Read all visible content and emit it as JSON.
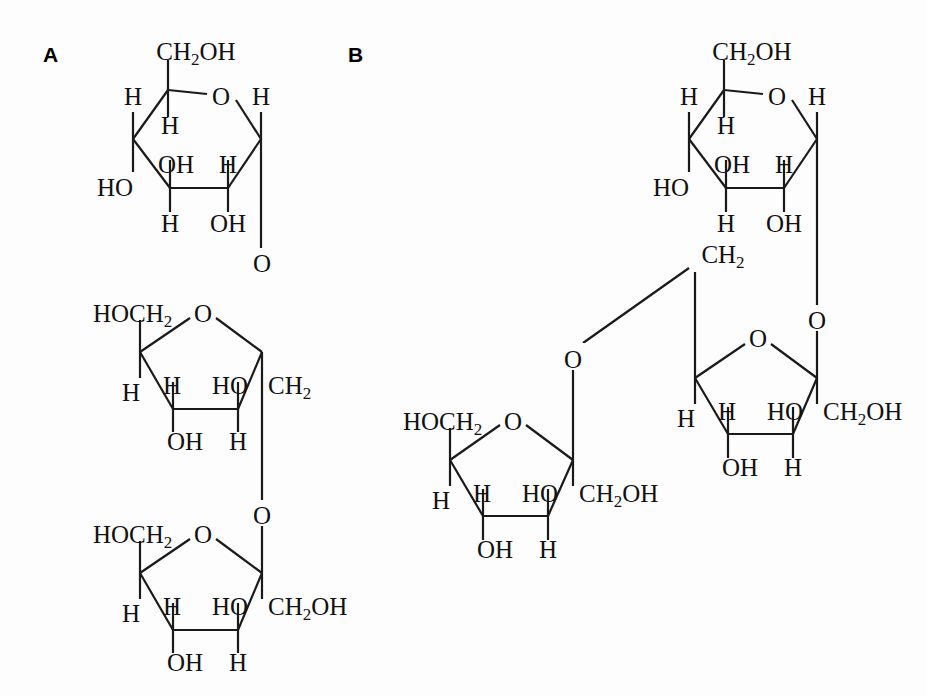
{
  "figure": {
    "background_color": "#fdfdfd",
    "ink_color": "#1a1a1a"
  },
  "panels": [
    {
      "id": "A",
      "label": "A",
      "description": "Linear trisaccharide: pyranose ring linked through oxygen to a furanose ring, which links through a CH2 and oxygen to a second furanose ring",
      "rings": [
        {
          "id": "A-pyranose",
          "type": "pyranose",
          "substituents": [
            "CH2OH",
            "O",
            "H",
            "H",
            "H",
            "OH",
            "H",
            "OH",
            "HO",
            "H"
          ]
        },
        {
          "id": "A-furanose-middle",
          "type": "furanose",
          "substituents": [
            "HOCH2",
            "O",
            "H",
            "H",
            "HO",
            "CH2",
            "OH",
            "H"
          ]
        },
        {
          "id": "A-furanose-bottom",
          "type": "furanose",
          "substituents": [
            "HOCH2",
            "O",
            "H",
            "H",
            "HO",
            "CH2OH",
            "OH",
            "H"
          ]
        }
      ],
      "linkers": [
        "O",
        "O"
      ]
    },
    {
      "id": "B",
      "label": "B",
      "description": "Branched trisaccharide: pyranose ring linked through oxygen to a furanose ring whose CH2 arm links through an oxygen to a second furanose ring",
      "rings": [
        {
          "id": "B-pyranose",
          "type": "pyranose",
          "substituents": [
            "CH2OH",
            "O",
            "H",
            "H",
            "H",
            "OH",
            "H",
            "OH",
            "HO",
            "H"
          ]
        },
        {
          "id": "B-furanose-right",
          "type": "furanose",
          "substituents": [
            "CH2",
            "O",
            "H",
            "H",
            "HO",
            "CH2OH",
            "OH",
            "H"
          ]
        },
        {
          "id": "B-furanose-left",
          "type": "furanose",
          "substituents": [
            "HOCH2",
            "O",
            "H",
            "H",
            "HO",
            "CH2OH",
            "OH",
            "H"
          ]
        }
      ],
      "linkers": [
        "O",
        "O"
      ]
    }
  ],
  "labels": {
    "panel_a": "A",
    "panel_b": "B",
    "ch2oh": "CH",
    "ch2oh_sub": "2",
    "ch2oh_tail": "OH",
    "hoch2_head": "HOCH",
    "hoch2_sub": "2",
    "ch2_head": "CH",
    "ch2_sub": "2",
    "oxygen": "O",
    "hydrogen": "H",
    "hydroxyl": "OH",
    "hydroxyl_left": "HO"
  },
  "atoms": {
    "panelA": {
      "pyranose": {
        "top_ch2oh": "CH2OH",
        "ring_oxygen": "O",
        "c5_axial_h": "H",
        "c4_left_h": "H",
        "c1_right_h": "H",
        "c3_oh": "OH",
        "c2_h": "H",
        "c4_ho": "HO",
        "c3_down_h": "H",
        "c2_down_oh": "OH"
      },
      "linker_top": "O",
      "furanose_middle": {
        "left_hoch2": "HOCH2",
        "ring_oxygen": "O",
        "c4_h_upper": "H",
        "c4_h_left": "H",
        "c2_ho": "HO",
        "c2_ch2": "CH2",
        "c3_oh": "OH",
        "c1_h": "H"
      },
      "linker_bottom": "O",
      "furanose_bottom": {
        "left_hoch2": "HOCH2",
        "ring_oxygen": "O",
        "c4_h_upper": "H",
        "c4_h_left": "H",
        "c2_ho": "HO",
        "c2_ch2oh": "CH2OH",
        "c3_oh": "OH",
        "c1_h": "H"
      }
    },
    "panelB": {
      "pyranose": {
        "top_ch2oh": "CH2OH",
        "ring_oxygen": "O",
        "c5_axial_h": "H",
        "c4_left_h": "H",
        "c1_right_h": "H",
        "c3_oh": "OH",
        "c2_h": "H",
        "c4_ho": "HO",
        "c3_down_h": "H",
        "c2_down_oh": "OH"
      },
      "linker_right": "O",
      "furanose_right": {
        "arm_ch2": "CH2",
        "ring_oxygen": "O",
        "c4_h_upper": "H",
        "c4_h_left": "H",
        "c2_ho": "HO",
        "c2_ch2oh": "CH2OH",
        "c3_oh": "OH",
        "c1_h": "H"
      },
      "linker_left": "O",
      "furanose_left": {
        "left_hoch2": "HOCH2",
        "ring_oxygen": "O",
        "c4_h_upper": "H",
        "c4_h_left": "H",
        "c2_ho": "HO",
        "c2_ch2oh": "CH2OH",
        "c3_oh": "OH",
        "c1_h": "H"
      }
    }
  }
}
